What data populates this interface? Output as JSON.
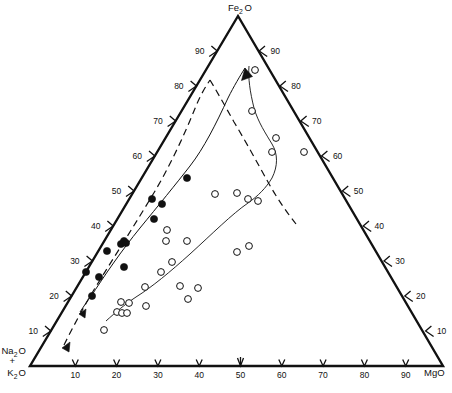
{
  "figure": {
    "type": "ternary-diagram",
    "title": "",
    "vertices": {
      "top": {
        "label_main": "Fe",
        "label_sub": "2",
        "label_tail": "O",
        "name": "FeO"
      },
      "bottom_left": {
        "line1_main": "Na",
        "line1_sub": "2",
        "line1_tail": "O",
        "plus": "+",
        "line2_main": "K",
        "line2_sub": "2",
        "line2_tail": "O",
        "name": "Na2O+K2O"
      },
      "bottom_right": {
        "label": "MgO",
        "name": "MgO"
      }
    },
    "axes": {
      "bottom": {
        "name": "MgO-axis",
        "ticks": [
          "10",
          "20",
          "30",
          "40",
          "50",
          "60",
          "70",
          "80",
          "90"
        ]
      },
      "left": {
        "name": "FeO-left-axis",
        "ticks": [
          "10",
          "20",
          "30",
          "40",
          "50",
          "60",
          "70",
          "80",
          "90"
        ]
      },
      "right": {
        "name": "MgO-right-axis",
        "ticks": [
          "10",
          "20",
          "30",
          "40",
          "50",
          "60",
          "70",
          "80",
          "90"
        ]
      }
    },
    "curves": {
      "tholeiitic_trend": {
        "name": "solid-trend-arrow",
        "style": "solid",
        "arrow": true
      },
      "calc_alkaline_boundary": {
        "name": "dashed-trend-arrow",
        "style": "dashed",
        "arrow": true
      },
      "field_envelope": {
        "name": "field-boundary-curve",
        "style": "solid",
        "arrow": false
      }
    },
    "legend": {
      "filled": "filled-circle-series",
      "open": "open-circle-series"
    }
  },
  "chart_data": {
    "type": "scatter",
    "title": "",
    "xlabel": "",
    "ylabel": "",
    "ternary_axes": [
      "FeO",
      "Na2O+K2O",
      "MgO"
    ],
    "axis_ranges": {
      "FeO": [
        0,
        100
      ],
      "Na2O+K2O": [
        0,
        100
      ],
      "MgO": [
        0,
        100
      ]
    },
    "grid": false,
    "legend_position": "none",
    "series": [
      {
        "name": "filled circles",
        "marker": "filled-circle",
        "points": [
          {
            "x": 86,
            "y": 272
          },
          {
            "x": 92,
            "y": 296
          },
          {
            "x": 99,
            "y": 277
          },
          {
            "x": 107,
            "y": 251
          },
          {
            "x": 121,
            "y": 244
          },
          {
            "x": 124,
            "y": 241
          },
          {
            "x": 126,
            "y": 243
          },
          {
            "x": 124,
            "y": 267
          },
          {
            "x": 154,
            "y": 219
          },
          {
            "x": 152,
            "y": 199
          },
          {
            "x": 162,
            "y": 204
          },
          {
            "x": 187,
            "y": 178
          }
        ]
      },
      {
        "name": "open circles",
        "marker": "open-circle",
        "points": [
          {
            "x": 255,
            "y": 70
          },
          {
            "x": 252,
            "y": 111
          },
          {
            "x": 276,
            "y": 138
          },
          {
            "x": 272,
            "y": 152
          },
          {
            "x": 304,
            "y": 152
          },
          {
            "x": 215,
            "y": 194
          },
          {
            "x": 237,
            "y": 193
          },
          {
            "x": 248,
            "y": 199
          },
          {
            "x": 258,
            "y": 201
          },
          {
            "x": 167,
            "y": 230
          },
          {
            "x": 166,
            "y": 241
          },
          {
            "x": 187,
            "y": 241
          },
          {
            "x": 249,
            "y": 246
          },
          {
            "x": 237,
            "y": 252
          },
          {
            "x": 172,
            "y": 262
          },
          {
            "x": 161,
            "y": 272
          },
          {
            "x": 145,
            "y": 287
          },
          {
            "x": 180,
            "y": 286
          },
          {
            "x": 198,
            "y": 288
          },
          {
            "x": 188,
            "y": 299
          },
          {
            "x": 121,
            "y": 302
          },
          {
            "x": 129,
            "y": 303
          },
          {
            "x": 146,
            "y": 306
          },
          {
            "x": 117,
            "y": 312
          },
          {
            "x": 122,
            "y": 313
          },
          {
            "x": 127,
            "y": 313
          },
          {
            "x": 104,
            "y": 330
          }
        ]
      }
    ]
  }
}
